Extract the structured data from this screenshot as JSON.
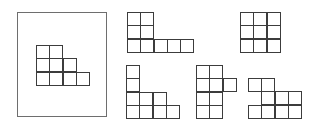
{
  "figure": {
    "reference": {
      "label": "reference-shape",
      "grid": [
        [
          1,
          1,
          0,
          0
        ],
        [
          1,
          1,
          1,
          0
        ],
        [
          1,
          1,
          1,
          1
        ]
      ]
    },
    "options": [
      {
        "label": "option-1",
        "grid": [
          [
            1,
            1,
            0,
            0,
            0
          ],
          [
            1,
            1,
            0,
            0,
            0
          ],
          [
            1,
            1,
            1,
            1,
            1
          ]
        ]
      },
      {
        "label": "option-2",
        "grid": [
          [
            1,
            1,
            1
          ],
          [
            1,
            1,
            1
          ],
          [
            1,
            1,
            1
          ]
        ]
      },
      {
        "label": "option-3",
        "grid": [
          [
            1,
            0,
            0,
            0
          ],
          [
            1,
            0,
            0,
            0
          ],
          [
            1,
            1,
            1,
            0
          ],
          [
            1,
            1,
            1,
            1
          ]
        ]
      },
      {
        "label": "option-4",
        "grid": [
          [
            1,
            1,
            0
          ],
          [
            1,
            1,
            1
          ],
          [
            1,
            1,
            0
          ],
          [
            1,
            1,
            0
          ]
        ]
      },
      {
        "label": "option-5",
        "grid": [
          [
            1,
            1,
            0,
            0
          ],
          [
            0,
            1,
            1,
            1
          ],
          [
            1,
            1,
            1,
            1
          ]
        ]
      }
    ]
  }
}
